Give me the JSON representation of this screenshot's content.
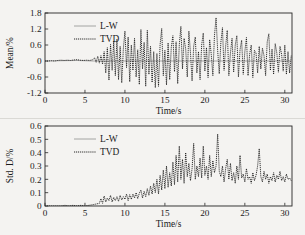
{
  "figure": {
    "background_color": "#f4f3f1",
    "ink_color": "#111111",
    "lw_color": "#8f8f8f",
    "panel_count": 2
  },
  "legend": {
    "entries": [
      {
        "label": "L-W",
        "style": "solid",
        "color": "#8f8f8f"
      },
      {
        "label": "TVD",
        "style": "dotted",
        "color": "#111111"
      }
    ],
    "position": "upper-left"
  },
  "chart_data": [
    {
      "type": "line",
      "title": "",
      "xlabel": "Time/s",
      "ylabel": "Mean/%",
      "xlim": [
        0,
        30.9
      ],
      "ylim": [
        -1.2,
        1.8
      ],
      "xticks": [
        0,
        5,
        10,
        15,
        20,
        25,
        30
      ],
      "xticklabels": [
        "0",
        "5",
        "10",
        "15",
        "20",
        "25",
        "30"
      ],
      "yticks": [
        -1.2,
        -0.6,
        0,
        0.6,
        1.2,
        1.8
      ],
      "yticklabels": [
        "-1.2",
        "-0.6",
        "0",
        "0.6",
        "1.2",
        "1.8"
      ],
      "grid": false,
      "legend_position": "upper-left",
      "series": [
        {
          "name": "L-W",
          "style": "solid",
          "color": "#8f8f8f",
          "description": "Nearly flat near zero for the whole record, hidden beneath the TVD trace after t=6",
          "x": [
            0,
            2,
            4,
            6,
            8,
            10,
            12,
            14,
            16,
            18,
            20,
            22,
            24,
            26,
            28,
            30.8
          ],
          "values": [
            0,
            0.01,
            0.02,
            0.0,
            0.0,
            0.0,
            0.0,
            0.0,
            0.0,
            0.0,
            0.0,
            0.0,
            0.0,
            0.0,
            0.0,
            0.0
          ]
        },
        {
          "name": "TVD",
          "style": "dotted",
          "color": "#111111",
          "description": "Flat near zero until t~6, then rapidly growing high-frequency oscillation, peaks near 1.6 at t~21.5, troughs near -1.05",
          "x": [
            0.0,
            0.4,
            0.8,
            1.2,
            1.6,
            2.0,
            2.4,
            2.8,
            3.2,
            3.6,
            4.0,
            4.4,
            4.8,
            5.2,
            5.6,
            6.0,
            6.2,
            6.4,
            6.6,
            6.8,
            7.0,
            7.2,
            7.4,
            7.6,
            7.8,
            8.0,
            8.2,
            8.4,
            8.6,
            8.8,
            9.0,
            9.2,
            9.4,
            9.6,
            9.8,
            10.0,
            10.2,
            10.4,
            10.6,
            10.8,
            11.0,
            11.2,
            11.4,
            11.6,
            11.8,
            12.0,
            12.2,
            12.4,
            12.6,
            12.8,
            13.0,
            13.2,
            13.4,
            13.6,
            13.8,
            14.0,
            14.2,
            14.4,
            14.6,
            14.8,
            15.0,
            15.2,
            15.4,
            15.6,
            15.8,
            16.0,
            16.2,
            16.4,
            16.6,
            16.8,
            17.0,
            17.2,
            17.4,
            17.6,
            17.8,
            18.0,
            18.2,
            18.4,
            18.6,
            18.8,
            19.0,
            19.2,
            19.4,
            19.6,
            19.8,
            20.0,
            20.2,
            20.4,
            20.6,
            20.8,
            21.0,
            21.2,
            21.4,
            21.6,
            21.8,
            22.0,
            22.2,
            22.4,
            22.6,
            22.8,
            23.0,
            23.2,
            23.4,
            23.6,
            23.8,
            24.0,
            24.2,
            24.4,
            24.6,
            24.8,
            25.0,
            25.2,
            25.4,
            25.6,
            25.8,
            26.0,
            26.2,
            26.4,
            26.6,
            26.8,
            27.0,
            27.2,
            27.4,
            27.6,
            27.8,
            28.0,
            28.2,
            28.4,
            28.6,
            28.8,
            29.0,
            29.2,
            29.4,
            29.6,
            29.8,
            30.0,
            30.2,
            30.4,
            30.6,
            30.8
          ],
          "values": [
            0.0,
            0.0,
            0.01,
            0.0,
            0.02,
            0.03,
            0.02,
            0.03,
            0.02,
            0.04,
            0.05,
            0.03,
            0.02,
            0.03,
            0.02,
            0.05,
            0.12,
            -0.05,
            0.18,
            -0.08,
            0.2,
            -0.12,
            0.35,
            -0.45,
            0.5,
            -0.72,
            0.62,
            -0.35,
            0.75,
            -0.55,
            0.82,
            -0.7,
            0.55,
            -0.82,
            0.45,
            1.12,
            -0.25,
            0.9,
            -0.78,
            0.6,
            -0.35,
            0.85,
            -0.6,
            0.42,
            -0.88,
            1.18,
            -0.3,
            0.7,
            -0.95,
            1.15,
            -0.5,
            0.55,
            -0.8,
            0.35,
            -1.0,
            0.28,
            -0.95,
            0.62,
            1.22,
            -0.55,
            0.4,
            -0.9,
            0.68,
            -0.7,
            0.52,
            0.95,
            -0.4,
            0.72,
            -0.85,
            0.6,
            1.3,
            -0.3,
            0.85,
            0.45,
            -0.6,
            1.12,
            0.3,
            -0.75,
            0.55,
            0.9,
            -0.45,
            0.35,
            -0.7,
            0.6,
            1.05,
            -0.38,
            0.5,
            -0.62,
            0.8,
            0.25,
            -0.55,
            0.95,
            1.62,
            0.4,
            -0.48,
            0.7,
            1.25,
            -0.35,
            0.55,
            1.15,
            -0.55,
            0.3,
            0.85,
            -0.42,
            0.6,
            0.95,
            -0.6,
            0.42,
            0.78,
            -0.5,
            0.35,
            0.88,
            -0.55,
            0.25,
            0.6,
            -0.62,
            0.4,
            0.3,
            -0.45,
            0.55,
            -0.3,
            0.48,
            0.2,
            -0.55,
            0.72,
            1.02,
            -0.35,
            0.45,
            -0.5,
            0.65,
            0.3,
            -0.42,
            0.55,
            0.25,
            -0.38,
            0.6,
            -0.5,
            0.35,
            -0.45,
            0.2,
            -0.52,
            0.1
          ]
        }
      ]
    },
    {
      "type": "line",
      "title": "",
      "xlabel": "Time/s",
      "ylabel": "Std. D/%",
      "xlim": [
        0,
        30.9
      ],
      "ylim": [
        0,
        0.6
      ],
      "xticks": [
        0,
        5,
        10,
        15,
        20,
        25,
        30
      ],
      "xticklabels": [
        "0",
        "5",
        "10",
        "15",
        "20",
        "25",
        "30"
      ],
      "yticks": [
        0,
        0.1,
        0.2,
        0.3,
        0.4,
        0.5,
        0.6
      ],
      "yticklabels": [
        "0",
        "0.1",
        "0.2",
        "0.3",
        "0.4",
        "0.5",
        "0.6"
      ],
      "grid": false,
      "legend_position": "upper-left",
      "series": [
        {
          "name": "L-W",
          "style": "solid",
          "color": "#8f8f8f",
          "description": "Flat at zero across the whole record",
          "x": [
            0,
            5,
            10,
            15,
            20,
            25,
            30.8
          ],
          "values": [
            0.0,
            0.0,
            0.0,
            0.0,
            0.0,
            0.0,
            0.0
          ]
        },
        {
          "name": "TVD",
          "style": "dotted",
          "color": "#111111",
          "description": "Zero until t~7, then rising spiky envelope; maxima ~0.45 at t~16.8, ~0.47 at t~18.6, ~0.45 at t~19.8, peak ~0.54 at t~21.5, ~0.43 at t~26.8; settles to ~0.2 band after t~27",
          "x": [
            0.0,
            0.5,
            1.0,
            1.5,
            2.0,
            2.5,
            3.0,
            3.5,
            4.0,
            4.5,
            5.0,
            5.5,
            6.0,
            6.4,
            6.8,
            7.0,
            7.2,
            7.4,
            7.6,
            7.8,
            8.0,
            8.2,
            8.4,
            8.6,
            8.8,
            9.0,
            9.2,
            9.4,
            9.6,
            9.8,
            10.0,
            10.2,
            10.4,
            10.6,
            10.8,
            11.0,
            11.2,
            11.4,
            11.6,
            11.8,
            12.0,
            12.2,
            12.4,
            12.6,
            12.8,
            13.0,
            13.2,
            13.4,
            13.6,
            13.8,
            14.0,
            14.2,
            14.4,
            14.6,
            14.8,
            15.0,
            15.2,
            15.4,
            15.6,
            15.8,
            16.0,
            16.2,
            16.4,
            16.6,
            16.8,
            17.0,
            17.2,
            17.4,
            17.6,
            17.8,
            18.0,
            18.2,
            18.4,
            18.6,
            18.8,
            19.0,
            19.2,
            19.4,
            19.6,
            19.8,
            20.0,
            20.2,
            20.4,
            20.6,
            20.8,
            21.0,
            21.2,
            21.4,
            21.6,
            21.8,
            22.0,
            22.2,
            22.4,
            22.6,
            22.8,
            23.0,
            23.2,
            23.4,
            23.6,
            23.8,
            24.0,
            24.2,
            24.4,
            24.6,
            24.8,
            25.0,
            25.2,
            25.4,
            25.6,
            25.8,
            26.0,
            26.2,
            26.4,
            26.6,
            26.8,
            27.0,
            27.2,
            27.4,
            27.6,
            27.8,
            28.0,
            28.2,
            28.4,
            28.6,
            28.8,
            29.0,
            29.2,
            29.4,
            29.6,
            29.8,
            30.0,
            30.2,
            30.4,
            30.6,
            30.8
          ],
          "values": [
            0.0,
            0.0,
            0.0,
            0.0,
            0.0,
            0.005,
            0.0,
            0.005,
            0.0,
            0.005,
            0.0,
            0.005,
            0.01,
            0.015,
            0.02,
            0.055,
            0.02,
            0.075,
            0.03,
            0.06,
            0.04,
            0.08,
            0.03,
            0.065,
            0.04,
            0.07,
            0.035,
            0.08,
            0.045,
            0.07,
            0.05,
            0.09,
            0.04,
            0.085,
            0.05,
            0.09,
            0.06,
            0.1,
            0.055,
            0.095,
            0.12,
            0.06,
            0.11,
            0.07,
            0.13,
            0.08,
            0.15,
            0.09,
            0.17,
            0.1,
            0.2,
            0.09,
            0.23,
            0.12,
            0.27,
            0.13,
            0.3,
            0.14,
            0.25,
            0.15,
            0.33,
            0.16,
            0.38,
            0.18,
            0.45,
            0.2,
            0.35,
            0.17,
            0.4,
            0.22,
            0.32,
            0.19,
            0.28,
            0.47,
            0.2,
            0.3,
            0.22,
            0.36,
            0.21,
            0.45,
            0.23,
            0.3,
            0.2,
            0.38,
            0.22,
            0.34,
            0.25,
            0.3,
            0.54,
            0.26,
            0.22,
            0.3,
            0.18,
            0.28,
            0.35,
            0.2,
            0.32,
            0.19,
            0.25,
            0.17,
            0.3,
            0.2,
            0.38,
            0.21,
            0.24,
            0.18,
            0.28,
            0.2,
            0.22,
            0.17,
            0.25,
            0.19,
            0.23,
            0.3,
            0.43,
            0.22,
            0.18,
            0.26,
            0.2,
            0.24,
            0.17,
            0.22,
            0.19,
            0.25,
            0.18,
            0.23,
            0.2,
            0.26,
            0.19,
            0.22,
            0.18,
            0.24,
            0.2,
            0.21,
            0.19
          ]
        }
      ]
    }
  ]
}
